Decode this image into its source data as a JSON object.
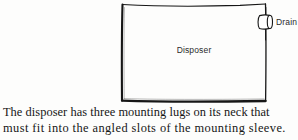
{
  "figure": {
    "body_label": "Disposer",
    "drain_label": "Drain",
    "ink_color": "#161616",
    "paper_color": "#fdfdfc"
  },
  "caption": {
    "line1": "The disposer has three mounting lugs on its neck that",
    "line2": "must fit into the angled slots of the mounting sleeve."
  }
}
